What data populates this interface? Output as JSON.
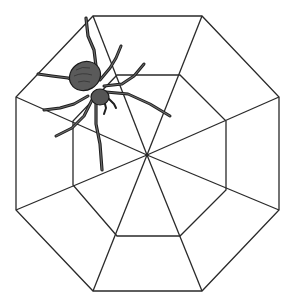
{
  "image": {
    "subject": "spider on an octagonal spider web",
    "colors": {
      "background": "#ffffff",
      "web_line": "#2a2a2a",
      "spider_body": "#5a5a5a",
      "spider_outline": "#1a1a1a",
      "spider_leg": "#3a3a3a"
    },
    "web": {
      "center": [
        147,
        155
      ],
      "outer_octagon": [
        [
          93,
          16
        ],
        [
          202,
          16
        ],
        [
          279,
          97
        ],
        [
          279,
          210
        ],
        [
          202,
          291
        ],
        [
          93,
          291
        ],
        [
          16,
          210
        ],
        [
          16,
          97
        ]
      ],
      "inner_octagon": [
        [
          117,
          75
        ],
        [
          180,
          75
        ],
        [
          226,
          121
        ],
        [
          226,
          190
        ],
        [
          180,
          236
        ],
        [
          117,
          236
        ],
        [
          73,
          185
        ],
        [
          73,
          121
        ]
      ]
    }
  }
}
